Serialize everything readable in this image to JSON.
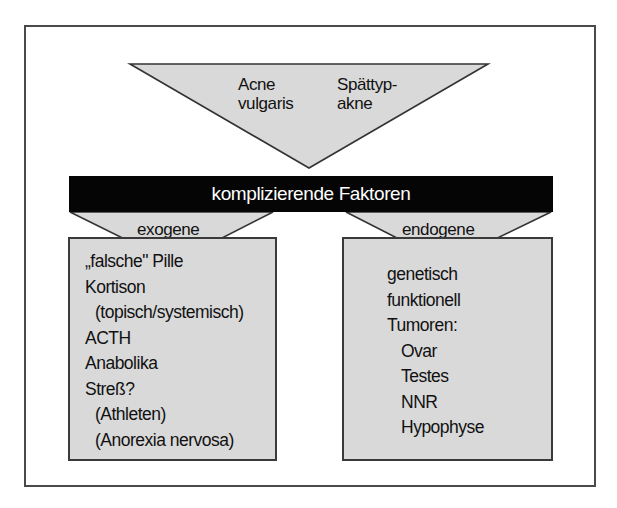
{
  "diagram": {
    "top_triangle": {
      "left_label": [
        "Acne",
        "vulgaris"
      ],
      "right_label": [
        "Spättyp-",
        "akne"
      ]
    },
    "bar_label": "komplizierende Faktoren",
    "branches": [
      {
        "label": "exogene",
        "items": [
          {
            "text": "„falsche\" Pille",
            "indent": 0
          },
          {
            "text": "Kortison",
            "indent": 0
          },
          {
            "text": "(topisch/systemisch)",
            "indent": 1
          },
          {
            "text": "ACTH",
            "indent": 0
          },
          {
            "text": "Anabolika",
            "indent": 0
          },
          {
            "text": "Streß?",
            "indent": 0
          },
          {
            "text": "(Athleten)",
            "indent": 1
          },
          {
            "text": "(Anorexia nervosa)",
            "indent": 1
          }
        ]
      },
      {
        "label": "endogene",
        "items": [
          {
            "text": "genetisch",
            "indent": 0
          },
          {
            "text": "funktionell",
            "indent": 0
          },
          {
            "text": "Tumoren:",
            "indent": 0
          },
          {
            "text": "Ovar",
            "indent": 2
          },
          {
            "text": "Testes",
            "indent": 2
          },
          {
            "text": "NNR",
            "indent": 2
          },
          {
            "text": "Hypophyse",
            "indent": 2
          }
        ]
      }
    ],
    "colors": {
      "shape_fill": "#d9d9d9",
      "bar_fill": "#050505",
      "bar_text": "#ffffff",
      "outline": "#333333",
      "text": "#111111"
    }
  }
}
